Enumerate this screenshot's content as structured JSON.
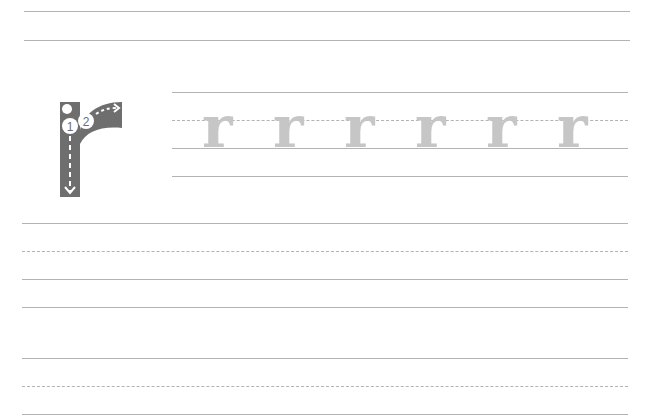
{
  "worksheet": {
    "letter": "r",
    "model": {
      "stroke_numbers": [
        "1",
        "2"
      ],
      "fill_color": "#6e6e6e"
    },
    "trace_row": {
      "letters": [
        "r",
        "r",
        "r",
        "r",
        "r",
        "r"
      ],
      "trace_color": "#c6c6c6"
    },
    "line_color": "#b3b3b3"
  }
}
